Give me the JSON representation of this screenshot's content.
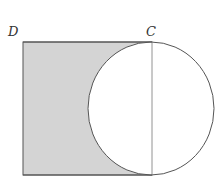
{
  "diagram": {
    "labels": {
      "top_left_vertex": "D",
      "top_right_vertex": "C"
    },
    "colors": {
      "shaded_region": "#d4d4d4",
      "stroke": "#555555",
      "background": "#ffffff"
    },
    "shapes": {
      "square": {
        "x": 23,
        "y": 42,
        "width": 129,
        "height": 133
      },
      "circle": {
        "cx": 151,
        "cy": 108.5,
        "rx": 63,
        "ry": 66.5
      },
      "vertical_diameter": {
        "x": 152,
        "y1": 42,
        "y2": 175
      }
    }
  }
}
